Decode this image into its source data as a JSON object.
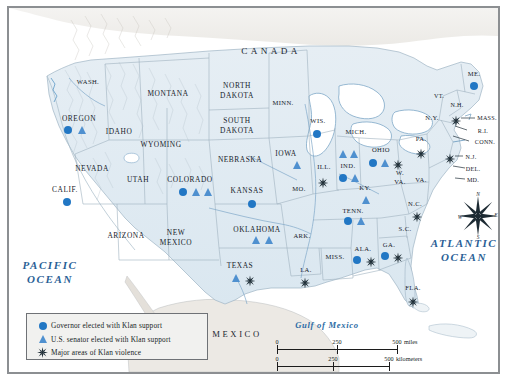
{
  "map": {
    "title": "Ku Klux Klan Political Influence and Violence Map",
    "countries": [
      {
        "name": "CANADA",
        "x": 262,
        "y": 44
      },
      {
        "name": "MEXICO",
        "x": 228,
        "y": 327
      }
    ],
    "oceans": [
      {
        "name": "PACIFIC\nOCEAN",
        "lines": [
          "PACIFIC",
          "OCEAN"
        ],
        "x": 41,
        "y": 265
      },
      {
        "name": "ATLANTIC\nOCEAN",
        "lines": [
          "ATLANTIC",
          "OCEAN"
        ],
        "x": 455,
        "y": 243
      }
    ],
    "seas": [
      {
        "name": "Gulf of Mexico",
        "x": 318,
        "y": 318
      }
    ],
    "states": [
      {
        "label": "WASH.",
        "x": 79,
        "y": 74,
        "size": "sm"
      },
      {
        "label": "OREGON",
        "x": 70,
        "y": 111,
        "size": "state"
      },
      {
        "label": "IDAHO",
        "x": 110,
        "y": 124,
        "size": "state"
      },
      {
        "label": "MONTANA",
        "x": 159,
        "y": 86,
        "size": "state"
      },
      {
        "label": "WYOMING",
        "x": 152,
        "y": 137,
        "size": "state"
      },
      {
        "label": "NEVADA",
        "x": 83,
        "y": 161,
        "size": "state"
      },
      {
        "label": "UTAH",
        "x": 129,
        "y": 172,
        "size": "state"
      },
      {
        "label": "CALIF.",
        "x": 56,
        "y": 182,
        "size": "state"
      },
      {
        "label": "ARIZONA",
        "x": 117,
        "y": 228,
        "size": "state"
      },
      {
        "label": "NEW",
        "x": 167,
        "y": 225,
        "size": "state"
      },
      {
        "label": "MEXICO",
        "x": 167,
        "y": 235,
        "size": "state"
      },
      {
        "label": "COLORADO",
        "x": 181,
        "y": 172,
        "size": "state"
      },
      {
        "label": "NORTH",
        "x": 228,
        "y": 78,
        "size": "state"
      },
      {
        "label": "DAKOTA",
        "x": 228,
        "y": 88,
        "size": "state"
      },
      {
        "label": "SOUTH",
        "x": 228,
        "y": 113,
        "size": "state"
      },
      {
        "label": "DAKOTA",
        "x": 228,
        "y": 123,
        "size": "state"
      },
      {
        "label": "NEBRASKA",
        "x": 231,
        "y": 152,
        "size": "state"
      },
      {
        "label": "KANSAS",
        "x": 238,
        "y": 183,
        "size": "state"
      },
      {
        "label": "OKLAHOMA",
        "x": 248,
        "y": 222,
        "size": "state"
      },
      {
        "label": "TEXAS",
        "x": 231,
        "y": 258,
        "size": "state"
      },
      {
        "label": "MINN.",
        "x": 274,
        "y": 95,
        "size": "sm"
      },
      {
        "label": "IOWA",
        "x": 277,
        "y": 146,
        "size": "state"
      },
      {
        "label": "MO.",
        "x": 290,
        "y": 181,
        "size": "sm"
      },
      {
        "label": "ARK.",
        "x": 293,
        "y": 228,
        "size": "sm"
      },
      {
        "label": "LA.",
        "x": 297,
        "y": 262,
        "size": "sm"
      },
      {
        "label": "WIS.",
        "x": 309,
        "y": 113,
        "size": "sm"
      },
      {
        "label": "ILL.",
        "x": 315,
        "y": 159,
        "size": "sm"
      },
      {
        "label": "IND.",
        "x": 339,
        "y": 158,
        "size": "sm"
      },
      {
        "label": "MICH.",
        "x": 347,
        "y": 124,
        "size": "sm"
      },
      {
        "label": "OHIO",
        "x": 372,
        "y": 142,
        "size": "sm"
      },
      {
        "label": "KY.",
        "x": 356,
        "y": 180,
        "size": "sm"
      },
      {
        "label": "TENN.",
        "x": 344,
        "y": 203,
        "size": "sm"
      },
      {
        "label": "MISS.",
        "x": 326,
        "y": 249,
        "size": "sm"
      },
      {
        "label": "ALA.",
        "x": 354,
        "y": 241,
        "size": "sm"
      },
      {
        "label": "GA.",
        "x": 380,
        "y": 237,
        "size": "sm"
      },
      {
        "label": "FLA.",
        "x": 404,
        "y": 280,
        "size": "sm"
      },
      {
        "label": "S.C.",
        "x": 396,
        "y": 221,
        "size": "sm"
      },
      {
        "label": "N.C.",
        "x": 406,
        "y": 196,
        "size": "sm"
      },
      {
        "label": "W.",
        "x": 391,
        "y": 165,
        "size": "sm"
      },
      {
        "label": "VA.",
        "x": 391,
        "y": 174,
        "size": "sm"
      },
      {
        "label": "VA.",
        "x": 412,
        "y": 172,
        "size": "sm"
      },
      {
        "label": "PA.",
        "x": 412,
        "y": 131,
        "size": "sm"
      },
      {
        "label": "N.Y.",
        "x": 423,
        "y": 110,
        "size": "sm"
      },
      {
        "label": "VT.",
        "x": 430,
        "y": 88,
        "size": "tiny"
      },
      {
        "label": "N.H.",
        "x": 448,
        "y": 97,
        "size": "tiny"
      },
      {
        "label": "ME.",
        "x": 465,
        "y": 66,
        "size": "sm"
      },
      {
        "label": "MASS.",
        "x": 478,
        "y": 110,
        "size": "tiny"
      },
      {
        "label": "R.I.",
        "x": 474,
        "y": 123,
        "size": "tiny"
      },
      {
        "label": "CONN.",
        "x": 476,
        "y": 134,
        "size": "tiny"
      },
      {
        "label": "N.J.",
        "x": 462,
        "y": 149,
        "size": "tiny"
      },
      {
        "label": "DEL.",
        "x": 464,
        "y": 161,
        "size": "tiny"
      },
      {
        "label": "MD.",
        "x": 464,
        "y": 172,
        "size": "tiny"
      }
    ],
    "markers": [
      {
        "type": "dot",
        "state": "OREGON",
        "x": 59,
        "y": 122
      },
      {
        "type": "tri",
        "state": "OREGON",
        "x": 73,
        "y": 122
      },
      {
        "type": "dot",
        "state": "CALIF.",
        "x": 58,
        "y": 194
      },
      {
        "type": "dot",
        "state": "COLORADO",
        "x": 174,
        "y": 184
      },
      {
        "type": "tri",
        "state": "COLORADO",
        "x": 187,
        "y": 184
      },
      {
        "type": "tri",
        "state": "COLORADO",
        "x": 199,
        "y": 184
      },
      {
        "type": "dot",
        "state": "KANSAS",
        "x": 243,
        "y": 196
      },
      {
        "type": "tri",
        "state": "OKLAHOMA",
        "x": 247,
        "y": 232
      },
      {
        "type": "tri",
        "state": "OKLAHOMA",
        "x": 260,
        "y": 232
      },
      {
        "type": "tri",
        "state": "TEXAS",
        "x": 227,
        "y": 270
      },
      {
        "type": "burst",
        "state": "TEXAS",
        "x": 241,
        "y": 270
      },
      {
        "type": "tri",
        "state": "IOWA",
        "x": 288,
        "y": 157
      },
      {
        "type": "dot",
        "state": "WIS.",
        "x": 308,
        "y": 126
      },
      {
        "type": "burst",
        "state": "ILL.",
        "x": 314,
        "y": 172
      },
      {
        "type": "burst",
        "state": "LA.",
        "x": 296,
        "y": 272
      },
      {
        "type": "tri",
        "state": "IND.",
        "x": 334,
        "y": 146
      },
      {
        "type": "tri",
        "state": "IND.",
        "x": 345,
        "y": 146
      },
      {
        "type": "dot",
        "state": "IND.",
        "x": 334,
        "y": 170
      },
      {
        "type": "tri",
        "state": "IND.",
        "x": 346,
        "y": 170
      },
      {
        "type": "dot",
        "state": "OHIO",
        "x": 364,
        "y": 155
      },
      {
        "type": "tri",
        "state": "OHIO",
        "x": 376,
        "y": 155
      },
      {
        "type": "burst",
        "state": "OHIO",
        "x": 389,
        "y": 154
      },
      {
        "type": "tri",
        "state": "KY.",
        "x": 357,
        "y": 192
      },
      {
        "type": "dot",
        "state": "TENN.",
        "x": 339,
        "y": 213
      },
      {
        "type": "tri",
        "state": "TENN.",
        "x": 352,
        "y": 213
      },
      {
        "type": "dot",
        "state": "ALA.",
        "x": 348,
        "y": 252
      },
      {
        "type": "burst",
        "state": "ALA.",
        "x": 362,
        "y": 251
      },
      {
        "type": "dot",
        "state": "GA.",
        "x": 376,
        "y": 248
      },
      {
        "type": "burst",
        "state": "GA.",
        "x": 389,
        "y": 247
      },
      {
        "type": "burst",
        "state": "N.C.",
        "x": 408,
        "y": 206
      },
      {
        "type": "burst",
        "state": "FLA.",
        "x": 404,
        "y": 291
      },
      {
        "type": "dot",
        "state": "ME.",
        "x": 465,
        "y": 78
      },
      {
        "type": "burst",
        "state": "MASS.",
        "x": 447,
        "y": 110
      },
      {
        "type": "burst",
        "state": "PA.",
        "x": 412,
        "y": 143
      },
      {
        "type": "burst",
        "state": "N.J.",
        "x": 441,
        "y": 148
      }
    ]
  },
  "legend": {
    "items": [
      {
        "symbol": "dot",
        "label": "Governor elected with Klan support"
      },
      {
        "symbol": "tri",
        "label": "U.S. senator elected with Klan support"
      },
      {
        "symbol": "burst",
        "label": "Major areas of Klan violence"
      }
    ]
  },
  "scale": {
    "miles": {
      "ticks": [
        "0",
        "250",
        "500"
      ],
      "unit": "miles"
    },
    "kilometers": {
      "ticks": [
        "0",
        "250",
        "500"
      ],
      "unit": "kilometers"
    }
  },
  "compass": {
    "north": "N",
    "east": "E",
    "south": "S",
    "west": "W"
  },
  "colors": {
    "governor_dot": "#2277c4",
    "senator_triangle": "#4f90cf",
    "violence_burst": "#1b2a33",
    "land": "#dfe9f0",
    "ocean_label": "#2b5f96",
    "frame": "#8c8f92"
  }
}
